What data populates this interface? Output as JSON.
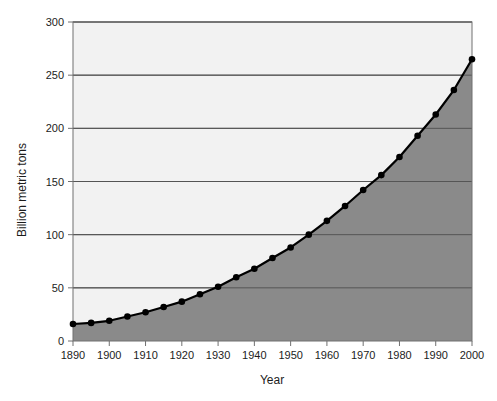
{
  "chart_data": {
    "type": "area",
    "title": "",
    "subtitle": "",
    "xlabel": "Year",
    "ylabel": "Billion metric tons",
    "xlim": [
      1890,
      2000
    ],
    "ylim": [
      0,
      300
    ],
    "grid": true,
    "grid_axis": "y",
    "legend": false,
    "legend_position": "none",
    "x_tick_labels": [
      "1890",
      "1900",
      "1910",
      "1920",
      "1930",
      "1940",
      "1950",
      "1960",
      "1970",
      "1980",
      "1990",
      "2000"
    ],
    "x_tick_values": [
      1890,
      1900,
      1910,
      1920,
      1930,
      1940,
      1950,
      1960,
      1970,
      1980,
      1990,
      2000
    ],
    "y_tick_labels": [
      "0",
      "50",
      "100",
      "150",
      "200",
      "250",
      "300"
    ],
    "y_tick_values": [
      0,
      50,
      100,
      150,
      200,
      250,
      300
    ],
    "x": [
      1890,
      1895,
      1900,
      1905,
      1910,
      1915,
      1920,
      1925,
      1930,
      1935,
      1940,
      1945,
      1950,
      1955,
      1960,
      1965,
      1970,
      1975,
      1980,
      1985,
      1990,
      1995,
      2000
    ],
    "values": [
      16,
      17,
      19,
      23,
      27,
      32,
      37,
      44,
      51,
      60,
      68,
      78,
      88,
      100,
      113,
      127,
      142,
      156,
      173,
      193,
      213,
      236,
      265
    ],
    "series": [
      {
        "name": "Cumulative emissions",
        "values": [
          16,
          17,
          19,
          23,
          27,
          32,
          37,
          44,
          51,
          60,
          68,
          78,
          88,
          100,
          113,
          127,
          142,
          156,
          173,
          193,
          213,
          236,
          265
        ]
      }
    ],
    "marker": "filled-circle",
    "annotations": []
  },
  "style": {
    "plot_background": "#f2f2f2",
    "area_fill": "#8a8a8a",
    "line_color": "#000000",
    "marker_color": "#000000",
    "grid_color": "#555555",
    "axis_color": "#707070",
    "figure_background": "#ffffff",
    "tick_label_color": "#1c1c1c"
  }
}
